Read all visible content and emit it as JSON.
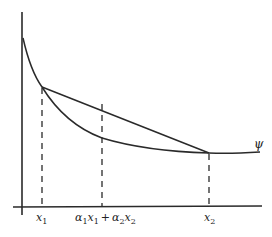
{
  "diagram": {
    "curve_label": "ψ",
    "x_labels": {
      "x1": "x",
      "x1_sub": "1",
      "mid_a1": "α",
      "mid_a1_sub": "1",
      "mid_x1": "x",
      "mid_x1_sub": "1",
      "plus": "+",
      "mid_a2": "α",
      "mid_a2_sub": "2",
      "mid_x2": "x",
      "mid_x2_sub": "2",
      "x2": "x",
      "x2_sub": "2"
    },
    "colors": {
      "line": "#2a2a2a",
      "background": "#ffffff"
    }
  }
}
